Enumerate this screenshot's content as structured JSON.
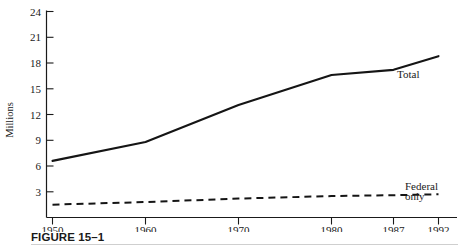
{
  "figure": {
    "caption_number": "FIGURE 15–1",
    "caption_tail": ""
  },
  "chart_data": {
    "type": "line",
    "title": "",
    "xlabel": "",
    "ylabel": "Millions",
    "x": [
      1950,
      1960,
      1970,
      1980,
      1987,
      1992
    ],
    "categories": [
      "1950",
      "1960",
      "1970",
      "1980",
      "1987",
      "1992"
    ],
    "xtick_labels": [
      "1950",
      "1960",
      "1970",
      "1980",
      "1987",
      "1992"
    ],
    "ytick_labels": [
      "3",
      "6",
      "9",
      "12",
      "15",
      "18",
      "21",
      "24"
    ],
    "ytick_values": [
      3,
      6,
      9,
      12,
      15,
      18,
      21,
      24
    ],
    "ylim": [
      0,
      24
    ],
    "xlim": [
      1950,
      1992
    ],
    "grid": false,
    "legend_position": "inline-right",
    "series": [
      {
        "name": "Total",
        "label": "Total",
        "style": "solid",
        "color": "#151515",
        "values": [
          6.6,
          8.8,
          13.1,
          16.6,
          17.2,
          18.8
        ]
      },
      {
        "name": "Federal only",
        "label_line1": "Federal",
        "label_line2": "only",
        "style": "dashed",
        "color": "#151515",
        "values": [
          1.5,
          1.8,
          2.2,
          2.5,
          2.6,
          2.7
        ]
      }
    ]
  }
}
